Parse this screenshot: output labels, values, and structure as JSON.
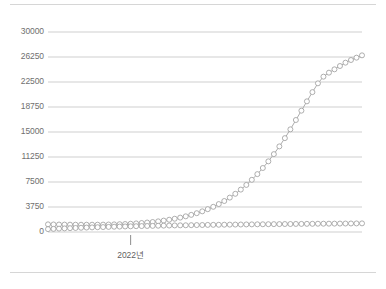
{
  "chart_data": {
    "type": "line",
    "title": "",
    "subtitle": "",
    "xlabel": "",
    "ylabel": "",
    "grid": true,
    "legend": false,
    "legend_position": "none",
    "ylim": [
      0,
      30000
    ],
    "y_ticks": [
      0,
      3750,
      7500,
      11250,
      15000,
      18750,
      22500,
      26250,
      30000
    ],
    "y_tick_labels": [
      "0",
      "3750",
      "7500",
      "11250",
      "15000",
      "18750",
      "22500",
      "26250",
      "30000"
    ],
    "x_tick_labels": [
      "2022년"
    ],
    "x_tick_positions": [
      15
    ],
    "x_count": 58,
    "marker": "open-circle",
    "marker_color": "#9a9a9a",
    "marker_fill": "#ffffff",
    "line_color": "#a3a3a3",
    "grid_color": "#c9c9c9",
    "axis_text_color": "#6f6f6f",
    "frame_color": "#d6d6d6",
    "series": [
      {
        "name": "rising",
        "values": [
          1150,
          1130,
          1120,
          1110,
          1100,
          1095,
          1090,
          1090,
          1095,
          1100,
          1110,
          1125,
          1145,
          1170,
          1200,
          1240,
          1290,
          1350,
          1420,
          1500,
          1600,
          1710,
          1840,
          1990,
          2160,
          2350,
          2570,
          2820,
          3100,
          3420,
          3780,
          4190,
          4650,
          5160,
          5730,
          6360,
          7060,
          7830,
          8680,
          9600,
          10600,
          11680,
          12840,
          14080,
          15400,
          16800,
          18200,
          19600,
          20980,
          22300,
          23300,
          23900,
          24400,
          24900,
          25400,
          25800,
          26150,
          26500
        ]
      },
      {
        "name": "flat",
        "values": [
          430,
          470,
          505,
          540,
          575,
          605,
          635,
          665,
          690,
          715,
          740,
          765,
          790,
          810,
          830,
          850,
          870,
          890,
          905,
          920,
          940,
          955,
          970,
          985,
          1000,
          1010,
          1025,
          1040,
          1050,
          1065,
          1075,
          1085,
          1095,
          1105,
          1115,
          1125,
          1135,
          1145,
          1155,
          1160,
          1170,
          1180,
          1185,
          1195,
          1200,
          1210,
          1215,
          1225,
          1230,
          1240,
          1245,
          1250,
          1258,
          1265,
          1270,
          1278,
          1285,
          1295
        ]
      }
    ]
  },
  "plot_geometry": {
    "left": 48,
    "right": 362,
    "top": 32,
    "bottom": 232
  }
}
